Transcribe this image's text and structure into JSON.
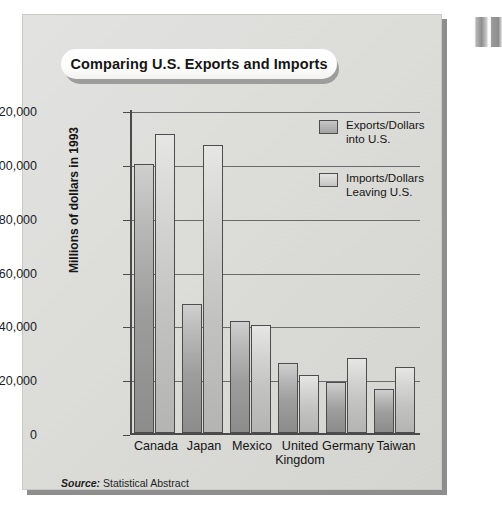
{
  "panel": {
    "title": "Comparing U.S. Exports and Imports",
    "source_key": "Source:",
    "source_value": " Statistical Abstract"
  },
  "legend": [
    {
      "label_line1": "Exports/Dollars",
      "label_line2": "into U.S.",
      "series": "exports",
      "color": "#a3a3a3"
    },
    {
      "label_line1": "Imports/Dollars",
      "label_line2": "Leaving U.S.",
      "series": "imports",
      "color": "#c5c5c3"
    }
  ],
  "axis": {
    "y_title": "Millions of dollars in 1993",
    "y_ticks": [
      "0",
      "20,000",
      "40,000",
      "60,000",
      "80,000",
      "100,000",
      "120,000"
    ]
  },
  "chart_data": {
    "type": "bar",
    "title": "Comparing U.S. Exports and Imports",
    "xlabel": "",
    "ylabel": "Millions of dollars in 1993",
    "ylim": [
      0,
      120000
    ],
    "ytick_values": [
      0,
      20000,
      40000,
      60000,
      80000,
      100000,
      120000
    ],
    "grid": true,
    "legend_position": "top-right-inside",
    "categories": [
      "Canada",
      "Japan",
      "Mexico",
      "United Kingdom",
      "Germany",
      "Taiwan"
    ],
    "category_label_lines": [
      [
        "Canada",
        ""
      ],
      [
        "Japan",
        ""
      ],
      [
        "Mexico",
        ""
      ],
      [
        "United",
        "Kingdom"
      ],
      [
        "Germany",
        ""
      ],
      [
        "Taiwan",
        ""
      ]
    ],
    "series": [
      {
        "name": "Exports/Dollars into U.S.",
        "values": [
          100000,
          48000,
          41500,
          26000,
          18800,
          16200
        ]
      },
      {
        "name": "Imports/Dollars Leaving U.S.",
        "values": [
          111000,
          107000,
          40000,
          21500,
          28000,
          24600
        ]
      }
    ],
    "source": "Source: Statistical Abstract"
  }
}
